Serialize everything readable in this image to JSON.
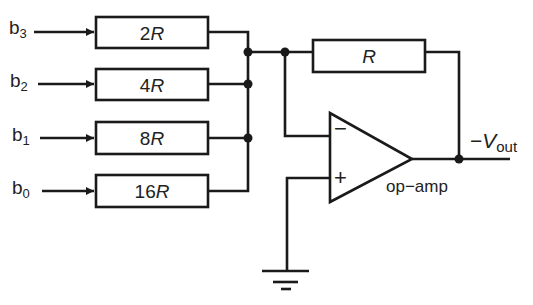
{
  "diagram": {
    "type": "binary-weighted DAC (summing amplifier)",
    "inputs": [
      {
        "bit": "b",
        "index": "3",
        "resistor": "2",
        "unit": "R"
      },
      {
        "bit": "b",
        "index": "2",
        "resistor": "4",
        "unit": "R"
      },
      {
        "bit": "b",
        "index": "1",
        "resistor": "8",
        "unit": "R"
      },
      {
        "bit": "b",
        "index": "0",
        "resistor": "16",
        "unit": "R"
      }
    ],
    "feedback_resistor": "R",
    "opamp": {
      "label": "op−amp",
      "inverting_symbol": "−",
      "noninverting_symbol": "+"
    },
    "output": {
      "prefix": "−",
      "symbol": "V",
      "subscript": "out"
    },
    "colors": {
      "line": "#1a1a1a",
      "background": "#ffffff"
    }
  }
}
